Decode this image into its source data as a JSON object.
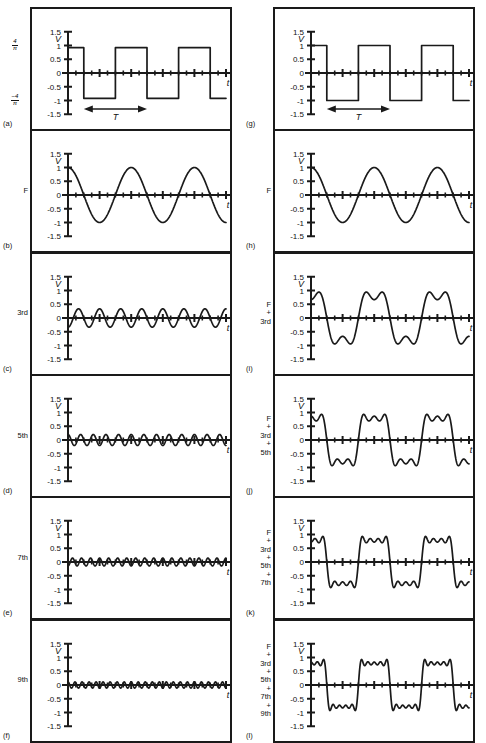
{
  "figure": {
    "width": 486,
    "height": 738,
    "background": "#ffffff",
    "stroke_color": "#1a1a1a",
    "axis_color": "#1a1a1a",
    "columns": 2,
    "rows": 6
  },
  "axes": {
    "y_ticks": [
      "1.5",
      "1",
      "0.5",
      "0",
      "-0.5",
      "-1",
      "-1.5"
    ],
    "y_tick_values": [
      1.5,
      1,
      0.5,
      0,
      -0.5,
      -1,
      -1.5
    ],
    "y_axis_label": "V",
    "x_axis_label": "t",
    "ylim": [
      -1.5,
      1.5
    ],
    "xlim": [
      0,
      2.5
    ],
    "x_minor_ticks": 20,
    "grid": false
  },
  "period_marker": {
    "label": "T",
    "style": "double-headed-arrow",
    "x_start": 0.25,
    "x_end": 1.25
  },
  "chart_data": [
    {
      "id": "a",
      "tag": "(a)",
      "column": "left",
      "row": 1,
      "type": "line",
      "side_label": "",
      "side_label_lines": [],
      "left_fractions": [
        {
          "num": "4",
          "den": "π",
          "sign": "",
          "y_value": 1.0
        },
        {
          "num": "4",
          "den": "π",
          "sign": "−",
          "y_value": -1.0
        }
      ],
      "waveform": "square",
      "amplitude": 0.92,
      "harmonic": 1,
      "cycles": 2.5,
      "phase": 0,
      "show_period_arrow": true,
      "title": "",
      "xlabel": "t",
      "ylabel": "V",
      "ylim": [
        -1.5,
        1.5
      ]
    },
    {
      "id": "b",
      "tag": "(b)",
      "column": "left",
      "row": 2,
      "type": "line",
      "side_label": "F",
      "side_label_lines": [
        "F"
      ],
      "left_fractions": [],
      "waveform": "cos",
      "amplitude": 1.0,
      "harmonic": 1,
      "cycles": 2.5,
      "phase": 0,
      "show_period_arrow": false,
      "title": "",
      "xlabel": "t",
      "ylabel": "V",
      "ylim": [
        -1.5,
        1.5
      ]
    },
    {
      "id": "c",
      "tag": "(c)",
      "column": "left",
      "row": 3,
      "type": "line",
      "side_label": "3rd",
      "side_label_lines": [
        "3rd"
      ],
      "left_fractions": [],
      "waveform": "cos",
      "amplitude": -0.3333,
      "harmonic": 3,
      "cycles": 7.5,
      "phase": 0,
      "show_period_arrow": false,
      "title": "",
      "xlabel": "t",
      "ylabel": "V",
      "ylim": [
        -1.5,
        1.5
      ]
    },
    {
      "id": "d",
      "tag": "(d)",
      "column": "left",
      "row": 4,
      "type": "line",
      "side_label": "5th",
      "side_label_lines": [
        "5th"
      ],
      "left_fractions": [],
      "waveform": "cos",
      "amplitude": 0.2,
      "harmonic": 5,
      "cycles": 12.5,
      "phase": 0,
      "show_period_arrow": false,
      "title": "",
      "xlabel": "t",
      "ylabel": "V",
      "ylim": [
        -1.5,
        1.5
      ]
    },
    {
      "id": "e",
      "tag": "(e)",
      "column": "left",
      "row": 5,
      "type": "line",
      "side_label": "7th",
      "side_label_lines": [
        "7th"
      ],
      "left_fractions": [],
      "waveform": "cos",
      "amplitude": -0.1429,
      "harmonic": 7,
      "cycles": 17.5,
      "phase": 0,
      "show_period_arrow": false,
      "title": "",
      "xlabel": "t",
      "ylabel": "V",
      "ylim": [
        -1.5,
        1.5
      ]
    },
    {
      "id": "f",
      "tag": "(f)",
      "column": "left",
      "row": 6,
      "type": "line",
      "side_label": "9th",
      "side_label_lines": [
        "9th"
      ],
      "left_fractions": [],
      "waveform": "cos",
      "amplitude": 0.1111,
      "harmonic": 9,
      "cycles": 22.5,
      "phase": 0,
      "show_period_arrow": false,
      "title": "",
      "xlabel": "t",
      "ylabel": "V",
      "ylim": [
        -1.5,
        1.5
      ]
    },
    {
      "id": "g",
      "tag": "(g)",
      "column": "right",
      "row": 1,
      "type": "line",
      "side_label": "",
      "side_label_lines": [],
      "left_fractions": [],
      "waveform": "square",
      "amplitude": 1.0,
      "harmonic": 1,
      "cycles": 2.5,
      "phase": 0,
      "show_period_arrow": true,
      "title": "",
      "xlabel": "t",
      "ylabel": "V",
      "ylim": [
        -1.5,
        1.5
      ]
    },
    {
      "id": "h",
      "tag": "(h)",
      "column": "right",
      "row": 2,
      "type": "line",
      "side_label": "F",
      "side_label_lines": [
        "F"
      ],
      "left_fractions": [],
      "waveform": "sum",
      "harmonics": [
        1
      ],
      "cycles": 2.5,
      "show_period_arrow": false,
      "title": "",
      "xlabel": "t",
      "ylabel": "V",
      "ylim": [
        -1.5,
        1.5
      ]
    },
    {
      "id": "i",
      "tag": "(i)",
      "column": "right",
      "row": 3,
      "type": "line",
      "side_label": "F + 3rd",
      "side_label_lines": [
        "F",
        "+",
        "3rd"
      ],
      "left_fractions": [],
      "waveform": "sum",
      "harmonics": [
        1,
        3
      ],
      "cycles": 2.5,
      "show_period_arrow": false,
      "title": "",
      "xlabel": "t",
      "ylabel": "V",
      "ylim": [
        -1.5,
        1.5
      ]
    },
    {
      "id": "j",
      "tag": "(j)",
      "column": "right",
      "row": 4,
      "type": "line",
      "side_label": "F + 3rd + 5th",
      "side_label_lines": [
        "F",
        "+",
        "3rd",
        "+",
        "5th"
      ],
      "left_fractions": [],
      "waveform": "sum",
      "harmonics": [
        1,
        3,
        5
      ],
      "cycles": 2.5,
      "show_period_arrow": false,
      "title": "",
      "xlabel": "t",
      "ylabel": "V",
      "ylim": [
        -1.5,
        1.5
      ]
    },
    {
      "id": "k",
      "tag": "(k)",
      "column": "right",
      "row": 5,
      "type": "line",
      "side_label": "F + 3rd + 5th + 7th",
      "side_label_lines": [
        "F",
        "+",
        "3rd",
        "+",
        "5th",
        "+",
        "7th"
      ],
      "left_fractions": [],
      "waveform": "sum",
      "harmonics": [
        1,
        3,
        5,
        7
      ],
      "cycles": 2.5,
      "show_period_arrow": false,
      "title": "",
      "xlabel": "t",
      "ylabel": "V",
      "ylim": [
        -1.5,
        1.5
      ]
    },
    {
      "id": "l",
      "tag": "(l)",
      "column": "right",
      "row": 6,
      "type": "line",
      "side_label": "F + 3rd + 5th + 7th + 9th",
      "side_label_lines": [
        "F",
        "+",
        "3rd",
        "+",
        "5th",
        "+",
        "7th",
        "+",
        "9th"
      ],
      "left_fractions": [],
      "waveform": "sum",
      "harmonics": [
        1,
        3,
        5,
        7,
        9
      ],
      "cycles": 2.5,
      "show_period_arrow": false,
      "title": "",
      "xlabel": "t",
      "ylabel": "V",
      "ylim": [
        -1.5,
        1.5
      ]
    }
  ]
}
